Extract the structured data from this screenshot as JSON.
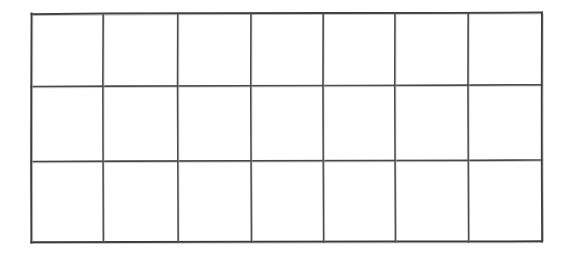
{
  "document": {
    "type": "scanned-grid-table",
    "title": "",
    "description": "Empty hand-drawn rectangular grid table",
    "background_color": "#ffffff",
    "line_color": "#474747",
    "line_color_dark": "#333333",
    "border_color": "#3c3c3c"
  },
  "grid": {
    "columns": 7,
    "rows": 3,
    "total_cells": 21,
    "bounds": {
      "left": 31,
      "top": 13,
      "right": 542,
      "bottom": 241,
      "width": 511,
      "height": 228
    },
    "column_edges_x": [
      31,
      103,
      178,
      251,
      323,
      395,
      468,
      542
    ],
    "row_edges_y": [
      13,
      85,
      160,
      241
    ],
    "column_widths": [
      72,
      75,
      73,
      72,
      72,
      73,
      74
    ],
    "row_heights": [
      72,
      75,
      81
    ],
    "line_width_px": 1.6,
    "outer_border_width_px": 2,
    "cells": [
      [
        "",
        "",
        "",
        "",
        "",
        "",
        ""
      ],
      [
        "",
        "",
        "",
        "",
        "",
        "",
        ""
      ],
      [
        "",
        "",
        "",
        "",
        "",
        "",
        ""
      ]
    ]
  },
  "column_headers": [
    "",
    "",
    "",
    "",
    "",
    "",
    ""
  ],
  "row_labels": [
    "",
    "",
    ""
  ],
  "notes": {
    "empty": "All 21 cells are blank — no text, numbers, or marks are rendered inside the grid."
  }
}
